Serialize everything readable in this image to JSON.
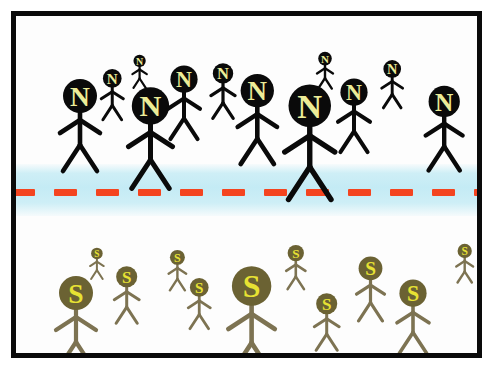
{
  "illustration": {
    "title": "Stick figure diagram of two groups separated by a border",
    "canvas": {
      "width": 495,
      "height": 371,
      "background": "#ffffff"
    },
    "frame": {
      "name": "picture-frame",
      "border_color": "#0a0a0a",
      "border_width": 5,
      "inner_background": "#fdfdfd"
    },
    "divider": {
      "name": "border-zone",
      "band_color": "#c4ebf5",
      "line_color": "#f4441f",
      "line_style": "dashed",
      "dash_width": 23,
      "dash_gap": 19,
      "dash_height": 7,
      "band_top": 148,
      "band_height": 52,
      "line_top": 173
    },
    "groups": [
      {
        "id": "north-group",
        "label": "N",
        "zone": "upper",
        "head_color": "#0a0a0a",
        "letter_color": "#ecec97",
        "limb_color": "#0a0a0a",
        "count": 10
      },
      {
        "id": "south-group",
        "label": "S",
        "zone": "lower",
        "head_color": "#6b6233",
        "letter_color": "#e7e233",
        "limb_color": "#7d7352",
        "count": 11
      }
    ],
    "figures_upper": [
      {
        "name": "figure-n-1",
        "letter": "N",
        "x": 64,
        "y": 80,
        "scale": 1.0,
        "stroke": 4.6
      },
      {
        "name": "figure-n-2",
        "letter": "N",
        "x": 96,
        "y": 62,
        "scale": 0.55,
        "stroke": 3.0
      },
      {
        "name": "figure-n-3",
        "letter": "N",
        "x": 124,
        "y": 45,
        "scale": 0.36,
        "stroke": 2.2
      },
      {
        "name": "figure-n-4",
        "letter": "N",
        "x": 134,
        "y": 90,
        "scale": 1.1,
        "stroke": 5.0
      },
      {
        "name": "figure-n-5",
        "letter": "N",
        "x": 168,
        "y": 63,
        "scale": 0.8,
        "stroke": 4.0
      },
      {
        "name": "figure-n-6",
        "letter": "N",
        "x": 207,
        "y": 57,
        "scale": 0.6,
        "stroke": 3.2
      },
      {
        "name": "figure-n-7",
        "letter": "N",
        "x": 241,
        "y": 75,
        "scale": 0.98,
        "stroke": 4.6
      },
      {
        "name": "figure-n-8",
        "letter": "N",
        "x": 309,
        "y": 43,
        "scale": 0.4,
        "stroke": 2.4
      },
      {
        "name": "figure-n-9",
        "letter": "N",
        "x": 294,
        "y": 90,
        "scale": 1.25,
        "stroke": 5.4
      },
      {
        "name": "figure-n-10",
        "letter": "N",
        "x": 338,
        "y": 76,
        "scale": 0.8,
        "stroke": 4.0
      },
      {
        "name": "figure-n-11",
        "letter": "N",
        "x": 376,
        "y": 53,
        "scale": 0.52,
        "stroke": 2.9
      },
      {
        "name": "figure-n-12",
        "letter": "N",
        "x": 428,
        "y": 85,
        "scale": 0.92,
        "stroke": 4.4
      }
    ],
    "figures_lower": [
      {
        "name": "figure-s-1",
        "letter": "S",
        "x": 60,
        "y": 277,
        "scale": 1.0,
        "stroke": 4.2
      },
      {
        "name": "figure-s-2",
        "letter": "S",
        "x": 81,
        "y": 237,
        "scale": 0.34,
        "stroke": 2.0
      },
      {
        "name": "figure-s-3",
        "letter": "S",
        "x": 111,
        "y": 261,
        "scale": 0.62,
        "stroke": 3.0
      },
      {
        "name": "figure-s-4",
        "letter": "S",
        "x": 161,
        "y": 241,
        "scale": 0.44,
        "stroke": 2.4
      },
      {
        "name": "figure-s-5",
        "letter": "S",
        "x": 183,
        "y": 271,
        "scale": 0.55,
        "stroke": 2.8
      },
      {
        "name": "figure-s-6",
        "letter": "S",
        "x": 236,
        "y": 270,
        "scale": 1.16,
        "stroke": 4.6
      },
      {
        "name": "figure-s-7",
        "letter": "S",
        "x": 280,
        "y": 237,
        "scale": 0.48,
        "stroke": 2.6
      },
      {
        "name": "figure-s-8",
        "letter": "S",
        "x": 311,
        "y": 288,
        "scale": 0.62,
        "stroke": 3.0
      },
      {
        "name": "figure-s-9",
        "letter": "S",
        "x": 354,
        "y": 252,
        "scale": 0.7,
        "stroke": 3.2
      },
      {
        "name": "figure-s-10",
        "letter": "S",
        "x": 397,
        "y": 277,
        "scale": 0.8,
        "stroke": 3.6
      },
      {
        "name": "figure-s-11",
        "letter": "S",
        "x": 449,
        "y": 235,
        "scale": 0.42,
        "stroke": 2.4
      }
    ]
  }
}
